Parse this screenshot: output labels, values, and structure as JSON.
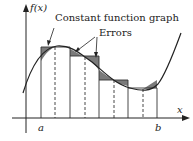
{
  "diagram": {
    "y_axis_label": "f(x)",
    "x_axis_label": "x",
    "a_label": "a",
    "b_label": "b",
    "callout_constant": "Constant function graph",
    "callout_errors": "Errors"
  },
  "colors": {
    "error_fill": "#7a7a7a",
    "line": "#222222"
  }
}
